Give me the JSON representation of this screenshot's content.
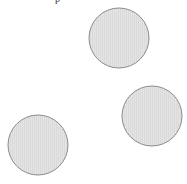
{
  "diagram": {
    "top_fragment_text": "p",
    "style": {
      "fill": "#e4e4e4",
      "stripe": "#d8d8d8",
      "stroke": "#8c8c8c",
      "background": "#ffffff"
    },
    "circles": [
      {
        "id": "top",
        "cx": 119,
        "cy": 38,
        "r": 30
      },
      {
        "id": "right",
        "cx": 152,
        "cy": 116,
        "r": 30
      },
      {
        "id": "bottom-left",
        "cx": 38,
        "cy": 145,
        "r": 30
      }
    ]
  }
}
